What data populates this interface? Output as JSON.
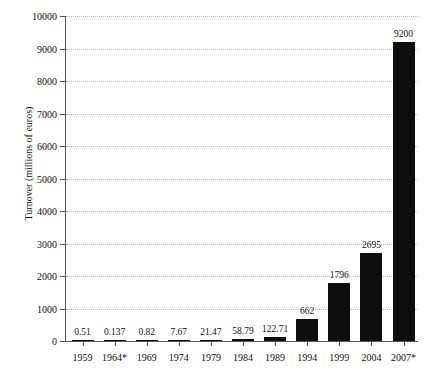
{
  "chart_data": {
    "type": "bar",
    "title": "",
    "xlabel": "",
    "ylabel": "Turnover (millions of euros)",
    "categories": [
      "1959",
      "1964*",
      "1969",
      "1974",
      "1979",
      "1984",
      "1989",
      "1994",
      "1999",
      "2004",
      "2007*"
    ],
    "values": [
      0.51,
      0.137,
      0.82,
      7.67,
      21.47,
      58.79,
      122.71,
      662,
      1796,
      2695,
      9200
    ],
    "value_labels": [
      "0.51",
      "0.137",
      "0.82",
      "7.67",
      "21.47",
      "58.79",
      "122.71",
      "662",
      "1796",
      "2695",
      "9200"
    ],
    "ylim": [
      0,
      10000
    ],
    "ytick_values": [
      0,
      1000,
      2000,
      3000,
      4000,
      5000,
      6000,
      7000,
      8000,
      9000,
      10000
    ],
    "ytick_labels": [
      "0",
      "1000",
      "2000",
      "3000",
      "4000",
      "5000",
      "6000",
      "7000",
      "8000",
      "9000",
      "10000"
    ],
    "grid": true,
    "legend": "none",
    "bar_color": "#0d0d0d",
    "grid_color": "#b9b9b9",
    "axis_color": "#555555"
  }
}
